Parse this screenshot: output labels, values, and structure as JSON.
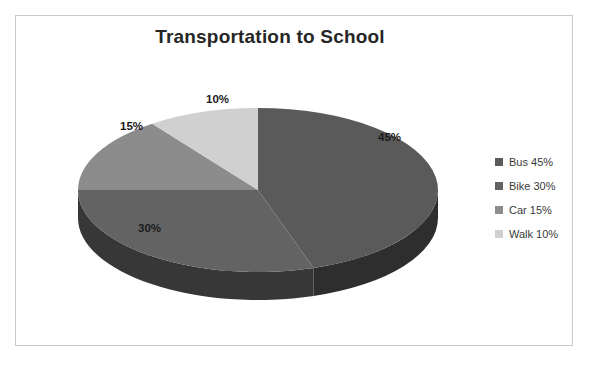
{
  "chart_data": {
    "type": "pie",
    "title": "Transportation to School",
    "categories": [
      "Bus",
      "Bike",
      "Car",
      "Walk"
    ],
    "values": [
      45,
      30,
      15,
      10
    ],
    "value_unit": "%",
    "slice_labels": [
      "45%",
      "30%",
      "15%",
      "10%"
    ],
    "legend_entries": [
      "Bus 45%",
      "Bike 30%",
      "Car 15%",
      "Walk 10%"
    ],
    "legend_position": "right",
    "three_d": true,
    "start_angle_deg": 0,
    "direction": "clockwise",
    "colors": [
      "#5a5a5a",
      "#636363",
      "#8c8c8c",
      "#d0d0d0"
    ],
    "side_colors": [
      "#2e2e2e",
      "#373737",
      "#4f4f4f",
      "#767676"
    ],
    "grid": false,
    "xlabel": "",
    "ylabel": ""
  },
  "title": {
    "text": "Transportation to School"
  },
  "slices": [
    {
      "name": "Bus",
      "label": "45%",
      "color": "#5a5a5a",
      "side_color": "#2e2e2e"
    },
    {
      "name": "Bike",
      "label": "30%",
      "color": "#636363",
      "side_color": "#373737"
    },
    {
      "name": "Car",
      "label": "15%",
      "color": "#8c8c8c",
      "side_color": "#4f4f4f"
    },
    {
      "name": "Walk",
      "label": "10%",
      "color": "#d0d0d0",
      "side_color": "#767676"
    }
  ],
  "legend": {
    "items": [
      {
        "label": "Bus 45%",
        "color": "#5a5a5a"
      },
      {
        "label": "Bike 30%",
        "color": "#636363"
      },
      {
        "label": "Car 15%",
        "color": "#8c8c8c"
      },
      {
        "label": "Walk 10%",
        "color": "#d0d0d0"
      }
    ]
  }
}
